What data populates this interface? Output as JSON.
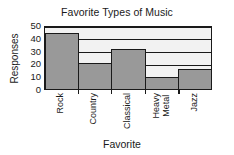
{
  "chart_data": {
    "type": "bar",
    "title": "Favorite Types of Music",
    "xlabel": "Favorite",
    "ylabel": "Responses",
    "categories": [
      "Rock",
      "Country",
      "Classical",
      "Heavy\nMetal",
      "Jazz"
    ],
    "values": [
      44,
      20,
      31,
      9,
      16
    ],
    "ylim": [
      0,
      50
    ],
    "yticks": [
      0,
      10,
      20,
      30,
      40,
      50
    ],
    "ytick_labels": [
      "0",
      "10",
      "20",
      "30",
      "40",
      "50"
    ],
    "grid": true,
    "grid_axis": "y",
    "legend": null,
    "bar_color": "#999999",
    "bar_edge_color": "#1a1a1a",
    "plot_background": "#f2f2f2",
    "page_background": "#ffffff",
    "text_color": "#1a1a1a"
  }
}
